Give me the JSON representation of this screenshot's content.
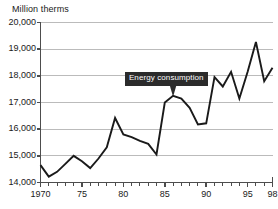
{
  "chart_data": {
    "type": "line",
    "title": "",
    "subtitle": "",
    "ylabel": "Million therms",
    "xlabel": "",
    "ylim": [
      14000,
      20000
    ],
    "ytick_labels": [
      "20,000",
      "19,000",
      "18,000",
      "17,000",
      "16,000",
      "15,000",
      "14,000"
    ],
    "ytick_values": [
      20000,
      19000,
      18000,
      17000,
      16000,
      15000,
      14000
    ],
    "xlim": [
      1970,
      1998
    ],
    "xtick_labels": [
      "1970",
      "75",
      "80",
      "85",
      "90",
      "95",
      "98"
    ],
    "xtick_values": [
      1970,
      1975,
      1980,
      1985,
      1990,
      1995,
      1998
    ],
    "minor_xticks_every": 1,
    "grid": "horizontal",
    "legend": "none",
    "series": [
      {
        "name": "Energy consumption",
        "color": "#1a1a1a",
        "x": [
          1970,
          1971,
          1972,
          1973,
          1974,
          1975,
          1976,
          1977,
          1978,
          1979,
          1980,
          1981,
          1982,
          1983,
          1984,
          1985,
          1986,
          1987,
          1988,
          1989,
          1990,
          1991,
          1992,
          1993,
          1994,
          1995,
          1996,
          1997,
          1998
        ],
        "values": [
          14650,
          14220,
          14400,
          14700,
          15000,
          14800,
          14540,
          14900,
          15320,
          16420,
          15800,
          15700,
          15560,
          15450,
          15050,
          17000,
          17250,
          17150,
          16800,
          16180,
          16220,
          17950,
          17600,
          18150,
          17150,
          18150,
          19270,
          17800,
          18300
        ]
      }
    ],
    "annotations": [
      {
        "text": "Energy consumption",
        "target_x": 1986,
        "target_y": 17250,
        "style": "dark-box-with-pointer"
      }
    ]
  },
  "colors": {
    "line": "#1a1a1a",
    "grid": "#b4b4b4",
    "axis": "#4d4d4d",
    "callout_bg": "#2b2b2b",
    "callout_text": "#ffffff",
    "background": "#ffffff"
  }
}
